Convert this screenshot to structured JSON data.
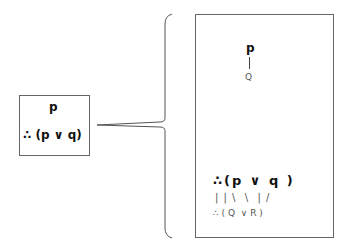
{
  "premise_box": {
    "premise": "p",
    "conclusion": "∴ (p ∨ q)"
  },
  "expansion_box": {
    "upper": {
      "symbol": "p",
      "connector": "|",
      "instance": "Q"
    },
    "lower": {
      "formula": "∴(p ∨ q )",
      "connectors": "| | \\  \\  | /",
      "instance": "∴ ( Q  ∨ R )"
    }
  }
}
